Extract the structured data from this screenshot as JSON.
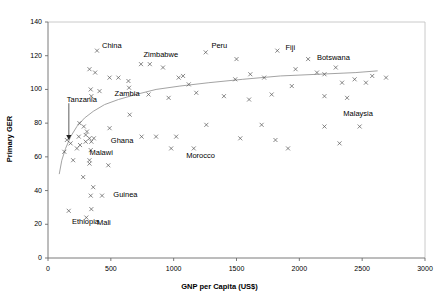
{
  "chart_data": {
    "type": "scatter",
    "title": "",
    "xlabel": "GNP per Capita (US$)",
    "ylabel": "Primary GER",
    "xlim": [
      0,
      3000
    ],
    "ylim": [
      0,
      140
    ],
    "xticks": [
      0,
      500,
      1000,
      1500,
      2000,
      2500,
      3000
    ],
    "yticks": [
      0,
      20,
      40,
      60,
      80,
      100,
      120,
      140
    ],
    "grid": false,
    "legend": null,
    "marker": "x",
    "marker_color": "#555555",
    "trendline": {
      "type": "logarithmic",
      "color": "#999999",
      "points": [
        [
          90,
          50
        ],
        [
          110,
          58
        ],
        [
          140,
          65
        ],
        [
          180,
          72
        ],
        [
          230,
          78
        ],
        [
          290,
          83
        ],
        [
          360,
          87
        ],
        [
          450,
          91
        ],
        [
          560,
          94
        ],
        [
          700,
          97
        ],
        [
          860,
          100
        ],
        [
          1050,
          102
        ],
        [
          1280,
          104
        ],
        [
          1550,
          106
        ],
        [
          1850,
          108
        ],
        [
          2150,
          109
        ],
        [
          2450,
          110
        ],
        [
          2620,
          111
        ]
      ]
    },
    "annotations": [
      {
        "label": "Tanzania",
        "text_x": 150,
        "text_y": 93,
        "arrow_to_x": 150,
        "arrow_to_y": 70
      },
      {
        "label": "China",
        "text_x": 430,
        "text_y": 125
      },
      {
        "label": "Zimbabwe",
        "text_x": 760,
        "text_y": 120
      },
      {
        "label": "Peru",
        "text_x": 1300,
        "text_y": 125
      },
      {
        "label": "Fiji",
        "text_x": 1890,
        "text_y": 124
      },
      {
        "label": "Botswana",
        "text_x": 2140,
        "text_y": 118
      },
      {
        "label": "Zambia",
        "text_x": 530,
        "text_y": 97
      },
      {
        "label": "Ghana",
        "text_x": 500,
        "text_y": 69
      },
      {
        "label": "Malawi",
        "text_x": 330,
        "text_y": 62
      },
      {
        "label": "Morocco",
        "text_x": 1100,
        "text_y": 60
      },
      {
        "label": "Malaysia",
        "text_x": 2350,
        "text_y": 85
      },
      {
        "label": "Guinea",
        "text_x": 520,
        "text_y": 37
      },
      {
        "label": "Ethiopia",
        "text_x": 190,
        "text_y": 21
      },
      {
        "label": "Mali",
        "text_x": 390,
        "text_y": 20
      }
    ],
    "points": [
      {
        "x": 390,
        "y": 123
      },
      {
        "x": 740,
        "y": 115
      },
      {
        "x": 810,
        "y": 115
      },
      {
        "x": 1255,
        "y": 122
      },
      {
        "x": 1825,
        "y": 123
      },
      {
        "x": 2070,
        "y": 118
      },
      {
        "x": 1500,
        "y": 118
      },
      {
        "x": 915,
        "y": 113
      },
      {
        "x": 330,
        "y": 112
      },
      {
        "x": 375,
        "y": 110
      },
      {
        "x": 1075,
        "y": 108
      },
      {
        "x": 1610,
        "y": 109
      },
      {
        "x": 2290,
        "y": 113
      },
      {
        "x": 1970,
        "y": 112
      },
      {
        "x": 490,
        "y": 107
      },
      {
        "x": 560,
        "y": 107
      },
      {
        "x": 640,
        "y": 105
      },
      {
        "x": 1040,
        "y": 107
      },
      {
        "x": 1720,
        "y": 107
      },
      {
        "x": 2580,
        "y": 108
      },
      {
        "x": 2440,
        "y": 106
      },
      {
        "x": 2690,
        "y": 107
      },
      {
        "x": 645,
        "y": 101
      },
      {
        "x": 1120,
        "y": 103
      },
      {
        "x": 2140,
        "y": 110
      },
      {
        "x": 2200,
        "y": 109
      },
      {
        "x": 340,
        "y": 100
      },
      {
        "x": 410,
        "y": 99
      },
      {
        "x": 345,
        "y": 96
      },
      {
        "x": 1490,
        "y": 106
      },
      {
        "x": 1940,
        "y": 102
      },
      {
        "x": 2340,
        "y": 104
      },
      {
        "x": 2530,
        "y": 104
      },
      {
        "x": 250,
        "y": 80
      },
      {
        "x": 800,
        "y": 97
      },
      {
        "x": 1180,
        "y": 98
      },
      {
        "x": 285,
        "y": 78
      },
      {
        "x": 245,
        "y": 72
      },
      {
        "x": 310,
        "y": 75
      },
      {
        "x": 650,
        "y": 85
      },
      {
        "x": 150,
        "y": 70
      },
      {
        "x": 330,
        "y": 71
      },
      {
        "x": 365,
        "y": 71
      },
      {
        "x": 490,
        "y": 77
      },
      {
        "x": 960,
        "y": 95
      },
      {
        "x": 1400,
        "y": 96
      },
      {
        "x": 1780,
        "y": 97
      },
      {
        "x": 2200,
        "y": 96
      },
      {
        "x": 180,
        "y": 68
      },
      {
        "x": 255,
        "y": 67
      },
      {
        "x": 300,
        "y": 69
      },
      {
        "x": 345,
        "y": 69
      },
      {
        "x": 745,
        "y": 72
      },
      {
        "x": 860,
        "y": 72
      },
      {
        "x": 1260,
        "y": 79
      },
      {
        "x": 1700,
        "y": 79
      },
      {
        "x": 2200,
        "y": 78
      },
      {
        "x": 130,
        "y": 63
      },
      {
        "x": 230,
        "y": 65
      },
      {
        "x": 340,
        "y": 64
      },
      {
        "x": 980,
        "y": 65
      },
      {
        "x": 2380,
        "y": 95
      },
      {
        "x": 1600,
        "y": 94
      },
      {
        "x": 200,
        "y": 58
      },
      {
        "x": 330,
        "y": 58
      },
      {
        "x": 330,
        "y": 56
      },
      {
        "x": 480,
        "y": 55
      },
      {
        "x": 280,
        "y": 48
      },
      {
        "x": 300,
        "y": 73
      },
      {
        "x": 1020,
        "y": 72
      },
      {
        "x": 1530,
        "y": 71
      },
      {
        "x": 1810,
        "y": 70
      },
      {
        "x": 2320,
        "y": 68
      },
      {
        "x": 360,
        "y": 42
      },
      {
        "x": 340,
        "y": 37
      },
      {
        "x": 430,
        "y": 37
      },
      {
        "x": 1160,
        "y": 65
      },
      {
        "x": 1910,
        "y": 65
      },
      {
        "x": 165,
        "y": 28
      },
      {
        "x": 345,
        "y": 29
      },
      {
        "x": 305,
        "y": 24
      },
      {
        "x": 2480,
        "y": 78
      }
    ]
  }
}
